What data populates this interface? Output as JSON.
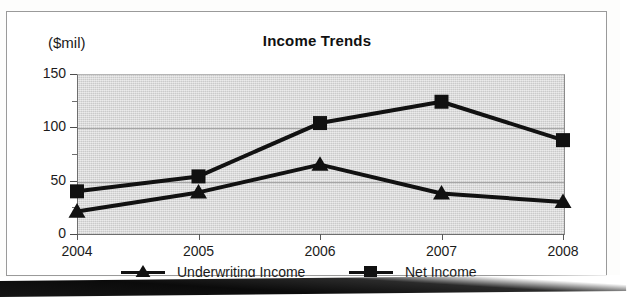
{
  "figure": {
    "title": "Income Trends",
    "y_axis_unit_label": "($mil)",
    "frame_color": "#9a9a9a",
    "plot_background_color": "#d9d9d9",
    "series_color": "#111111"
  },
  "legend": {
    "entries": [
      {
        "label": "Underwriting Income",
        "marker": "triangle-marker-icon"
      },
      {
        "label": "Net Income",
        "marker": "square-marker-icon"
      }
    ]
  },
  "chart_data": {
    "type": "line",
    "title": "Income Trends",
    "xlabel": "",
    "ylabel": "($mil)",
    "categories": [
      "2004",
      "2005",
      "2006",
      "2007",
      "2008"
    ],
    "x": [
      2004,
      2005,
      2006,
      2007,
      2008
    ],
    "ylim": [
      0,
      150
    ],
    "xtick_labels": [
      "2004",
      "2005",
      "2006",
      "2007",
      "2008"
    ],
    "ytick_labels": [
      "0",
      "50",
      "100",
      "150"
    ],
    "ytick_values": [
      0,
      50,
      100,
      150
    ],
    "yminor_tick_values": [
      25,
      75,
      125
    ],
    "grid": "horizontal-major",
    "legend_position": "bottom",
    "series": [
      {
        "name": "Underwriting Income",
        "marker": "triangle",
        "values": [
          21,
          39,
          65,
          38,
          30
        ]
      },
      {
        "name": "Net Income",
        "marker": "square",
        "values": [
          40,
          54,
          104,
          124,
          88
        ]
      }
    ]
  }
}
